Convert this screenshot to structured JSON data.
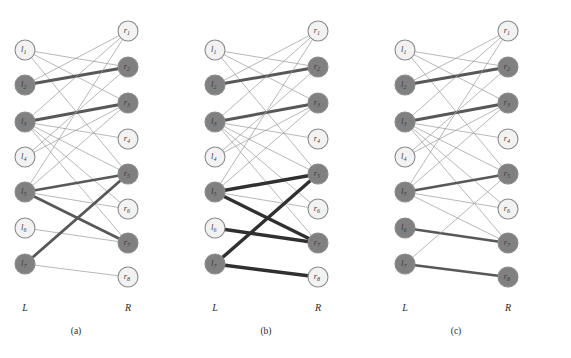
{
  "figure": {
    "width": 571,
    "height": 358,
    "background": "#ffffff",
    "colors": {
      "node_light_fill": "#f2f2f2",
      "node_dark_fill": "#808080",
      "node_stroke": "#8a8a8a",
      "edge_thin": "#9a9a9a",
      "edge_medium": "#707070",
      "edge_thick": "#585858",
      "edge_black": "#303030",
      "text": "#2b2b2b"
    },
    "node_radius": 10,
    "left_label": "L",
    "right_label": "R"
  },
  "chart_data": {
    "type": "diagram",
    "title": "",
    "subtitle": "",
    "left_nodes": [
      {
        "id": "l1",
        "label": "l",
        "sub": "1",
        "y": 50
      },
      {
        "id": "l2",
        "label": "l",
        "sub": "2",
        "y": 85
      },
      {
        "id": "l3",
        "label": "l",
        "sub": "3",
        "y": 122
      },
      {
        "id": "l4",
        "label": "l",
        "sub": "4",
        "y": 157
      },
      {
        "id": "l5",
        "label": "l",
        "sub": "5",
        "y": 192
      },
      {
        "id": "l6",
        "label": "l",
        "sub": "6",
        "y": 228
      },
      {
        "id": "l7",
        "label": "l",
        "sub": "7",
        "y": 264
      }
    ],
    "right_nodes": [
      {
        "id": "r1",
        "label": "r",
        "sub": "1",
        "y": 31
      },
      {
        "id": "r2",
        "label": "r",
        "sub": "2",
        "y": 67
      },
      {
        "id": "r3",
        "label": "r",
        "sub": "3",
        "y": 103
      },
      {
        "id": "r4",
        "label": "r",
        "sub": "4",
        "y": 139
      },
      {
        "id": "r5",
        "label": "r",
        "sub": "5",
        "y": 174
      },
      {
        "id": "r6",
        "label": "r",
        "sub": "6",
        "y": 209
      },
      {
        "id": "r7",
        "label": "r",
        "sub": "7",
        "y": 243
      },
      {
        "id": "r8",
        "label": "r",
        "sub": "8",
        "y": 277
      }
    ],
    "panels": [
      {
        "id": "a",
        "caption": "(a)",
        "left_x": 25,
        "right_x": 128,
        "caption_x": 76,
        "dark_left": [
          "l2",
          "l3",
          "l5",
          "l7"
        ],
        "dark_right": [
          "r2",
          "r3",
          "r5",
          "r7"
        ],
        "edges": [
          {
            "from": "l1",
            "to": "r2",
            "w": 0.7,
            "shade": "thin"
          },
          {
            "from": "l1",
            "to": "r3",
            "w": 0.7,
            "shade": "thin"
          },
          {
            "from": "l1",
            "to": "r5",
            "w": 0.7,
            "shade": "thin"
          },
          {
            "from": "l2",
            "to": "r1",
            "w": 0.7,
            "shade": "thin"
          },
          {
            "from": "l2",
            "to": "r2",
            "w": 3.0,
            "shade": "thick"
          },
          {
            "from": "l3",
            "to": "r1",
            "w": 0.7,
            "shade": "thin"
          },
          {
            "from": "l3",
            "to": "r3",
            "w": 3.0,
            "shade": "thick"
          },
          {
            "from": "l3",
            "to": "r4",
            "w": 0.7,
            "shade": "thin"
          },
          {
            "from": "l3",
            "to": "r5",
            "w": 0.7,
            "shade": "thin"
          },
          {
            "from": "l3",
            "to": "r6",
            "w": 0.7,
            "shade": "thin"
          },
          {
            "from": "l3",
            "to": "r7",
            "w": 0.7,
            "shade": "thin"
          },
          {
            "from": "l4",
            "to": "r2",
            "w": 0.7,
            "shade": "thin"
          },
          {
            "from": "l4",
            "to": "r3",
            "w": 0.7,
            "shade": "thin"
          },
          {
            "from": "l5",
            "to": "r1",
            "w": 0.7,
            "shade": "thin"
          },
          {
            "from": "l5",
            "to": "r3",
            "w": 0.7,
            "shade": "thin"
          },
          {
            "from": "l5",
            "to": "r5",
            "w": 2.4,
            "shade": "thick"
          },
          {
            "from": "l5",
            "to": "r6",
            "w": 0.7,
            "shade": "thin"
          },
          {
            "from": "l5",
            "to": "r7",
            "w": 2.8,
            "shade": "thick"
          },
          {
            "from": "l6",
            "to": "r7",
            "w": 0.7,
            "shade": "thin"
          },
          {
            "from": "l7",
            "to": "r5",
            "w": 2.8,
            "shade": "thick"
          },
          {
            "from": "l7",
            "to": "r8",
            "w": 0.7,
            "shade": "thin"
          }
        ]
      },
      {
        "id": "b",
        "caption": "(b)",
        "left_x": 215,
        "right_x": 318,
        "caption_x": 266,
        "dark_left": [
          "l2",
          "l3",
          "l5",
          "l7"
        ],
        "dark_right": [
          "r2",
          "r3",
          "r5",
          "r7"
        ],
        "edges": [
          {
            "from": "l1",
            "to": "r2",
            "w": 0.7,
            "shade": "thin"
          },
          {
            "from": "l1",
            "to": "r3",
            "w": 0.7,
            "shade": "thin"
          },
          {
            "from": "l1",
            "to": "r5",
            "w": 0.7,
            "shade": "thin"
          },
          {
            "from": "l2",
            "to": "r1",
            "w": 0.7,
            "shade": "thin"
          },
          {
            "from": "l2",
            "to": "r2",
            "w": 3.0,
            "shade": "thick"
          },
          {
            "from": "l3",
            "to": "r1",
            "w": 0.7,
            "shade": "thin"
          },
          {
            "from": "l3",
            "to": "r3",
            "w": 3.0,
            "shade": "thick"
          },
          {
            "from": "l3",
            "to": "r4",
            "w": 0.7,
            "shade": "thin"
          },
          {
            "from": "l3",
            "to": "r5",
            "w": 0.7,
            "shade": "thin"
          },
          {
            "from": "l3",
            "to": "r6",
            "w": 0.7,
            "shade": "thin"
          },
          {
            "from": "l3",
            "to": "r7",
            "w": 0.7,
            "shade": "thin"
          },
          {
            "from": "l4",
            "to": "r2",
            "w": 0.7,
            "shade": "thin"
          },
          {
            "from": "l4",
            "to": "r3",
            "w": 0.7,
            "shade": "thin"
          },
          {
            "from": "l5",
            "to": "r1",
            "w": 0.7,
            "shade": "thin"
          },
          {
            "from": "l5",
            "to": "r3",
            "w": 0.7,
            "shade": "thin"
          },
          {
            "from": "l5",
            "to": "r5",
            "w": 3.4,
            "shade": "black"
          },
          {
            "from": "l5",
            "to": "r6",
            "w": 0.7,
            "shade": "thin"
          },
          {
            "from": "l5",
            "to": "r7",
            "w": 3.4,
            "shade": "black"
          },
          {
            "from": "l6",
            "to": "r7",
            "w": 3.4,
            "shade": "black"
          },
          {
            "from": "l7",
            "to": "r5",
            "w": 3.4,
            "shade": "black"
          },
          {
            "from": "l7",
            "to": "r8",
            "w": 3.4,
            "shade": "black"
          }
        ]
      },
      {
        "id": "c",
        "caption": "(c)",
        "left_x": 405,
        "right_x": 508,
        "caption_x": 456,
        "dark_left": [
          "l2",
          "l3",
          "l5",
          "l6",
          "l7"
        ],
        "dark_right": [
          "r2",
          "r3",
          "r5",
          "r7",
          "r8"
        ],
        "edges": [
          {
            "from": "l1",
            "to": "r2",
            "w": 0.7,
            "shade": "thin"
          },
          {
            "from": "l1",
            "to": "r3",
            "w": 0.7,
            "shade": "thin"
          },
          {
            "from": "l1",
            "to": "r5",
            "w": 0.7,
            "shade": "thin"
          },
          {
            "from": "l2",
            "to": "r1",
            "w": 0.7,
            "shade": "thin"
          },
          {
            "from": "l2",
            "to": "r2",
            "w": 3.0,
            "shade": "thick"
          },
          {
            "from": "l3",
            "to": "r1",
            "w": 0.7,
            "shade": "thin"
          },
          {
            "from": "l3",
            "to": "r3",
            "w": 3.0,
            "shade": "thick"
          },
          {
            "from": "l3",
            "to": "r4",
            "w": 0.7,
            "shade": "thin"
          },
          {
            "from": "l3",
            "to": "r5",
            "w": 0.7,
            "shade": "thin"
          },
          {
            "from": "l3",
            "to": "r6",
            "w": 0.7,
            "shade": "thin"
          },
          {
            "from": "l3",
            "to": "r7",
            "w": 0.7,
            "shade": "thin"
          },
          {
            "from": "l4",
            "to": "r2",
            "w": 0.7,
            "shade": "thin"
          },
          {
            "from": "l4",
            "to": "r3",
            "w": 0.7,
            "shade": "thin"
          },
          {
            "from": "l5",
            "to": "r1",
            "w": 0.7,
            "shade": "thin"
          },
          {
            "from": "l5",
            "to": "r3",
            "w": 0.7,
            "shade": "thin"
          },
          {
            "from": "l5",
            "to": "r5",
            "w": 2.6,
            "shade": "thick"
          },
          {
            "from": "l5",
            "to": "r6",
            "w": 0.7,
            "shade": "thin"
          },
          {
            "from": "l5",
            "to": "r7",
            "w": 0.7,
            "shade": "thin"
          },
          {
            "from": "l6",
            "to": "r7",
            "w": 2.6,
            "shade": "thick"
          },
          {
            "from": "l7",
            "to": "r5",
            "w": 0.7,
            "shade": "thin"
          },
          {
            "from": "l7",
            "to": "r8",
            "w": 2.6,
            "shade": "thick"
          }
        ]
      }
    ],
    "axis_label_y": 311,
    "caption_y": 334
  }
}
